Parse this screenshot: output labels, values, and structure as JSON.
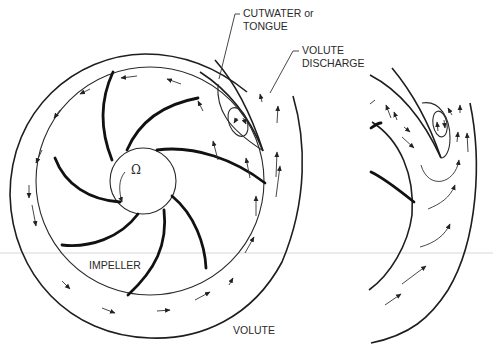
{
  "figure": {
    "labels": {
      "cutwater": "CUTWATER or",
      "cutwater_line2": "TONGUE",
      "discharge": "VOLUTE",
      "discharge_line2": "DISCHARGE",
      "impeller": "IMPELLER",
      "volute": "VOLUTE",
      "rotation_symbol": "Ω"
    },
    "colors": {
      "line": "#1e1e1e",
      "background": "#ffffff"
    }
  }
}
